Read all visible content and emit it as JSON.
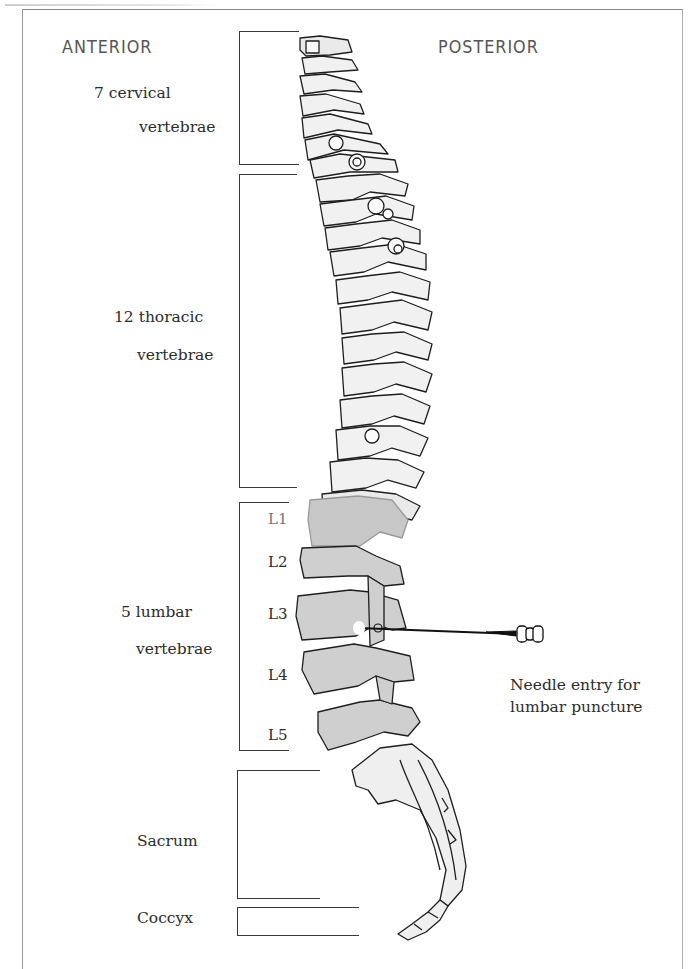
{
  "figure": {
    "orientation": {
      "anterior": "ANTERIOR",
      "posterior": "POSTERIOR"
    },
    "regions": [
      {
        "name": "cervical",
        "line1": "7 cervical",
        "line2": "vertebrae",
        "count": 7
      },
      {
        "name": "thoracic",
        "line1": "12 thoracic",
        "line2": "vertebrae",
        "count": 12
      },
      {
        "name": "lumbar",
        "line1": "5 lumbar",
        "line2": "vertebrae",
        "count": 5
      },
      {
        "name": "sacrum",
        "line1": "Sacrum"
      },
      {
        "name": "coccyx",
        "line1": "Coccyx"
      }
    ],
    "lumbar_levels": [
      "L1",
      "L2",
      "L3",
      "L4",
      "L5"
    ],
    "needle_annotation": {
      "line1": "Needle entry for",
      "line2": "lumbar puncture"
    },
    "colors": {
      "outline": "#1e1e1e",
      "bone_fill": "#f1f1f1",
      "lumbar_fill": "#cfcfcf",
      "frame": "#9a9a9a"
    }
  }
}
